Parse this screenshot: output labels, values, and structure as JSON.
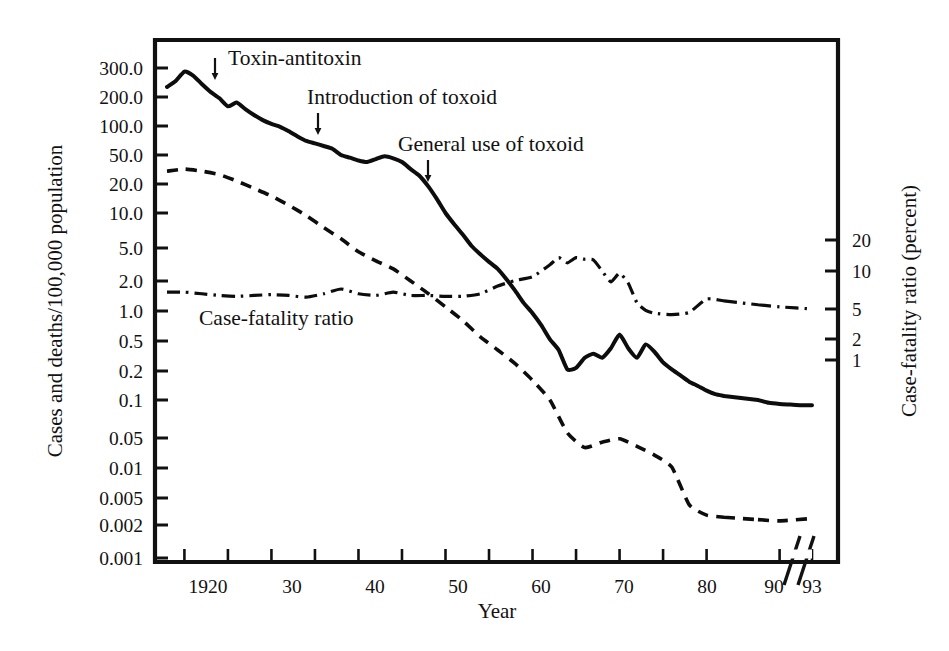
{
  "chart_data": {
    "type": "line",
    "title": "",
    "xlabel": "Year",
    "ylabel": "Cases and deaths/100,000 population",
    "ylabel_right": "Case-fatality ratio (percent)",
    "yscale": "log",
    "xlim": [
      1918,
      1993
    ],
    "axis_break": {
      "present": true,
      "between": [
        1982,
        1988
      ]
    },
    "grid": false,
    "legend_position": "inline-annotations",
    "yticks_left": [
      "300.0",
      "200.0",
      "100.0",
      "50.0",
      "20.0",
      "10.0",
      "5.0",
      "2.0",
      "1.0",
      "0.5",
      "0.2",
      "0.1",
      "0.05",
      "0.01",
      "0.005",
      "0.002",
      "0.001"
    ],
    "ytick_values_left": [
      300,
      200,
      100,
      50,
      20,
      10,
      5,
      2,
      1,
      0.5,
      0.2,
      0.1,
      0.05,
      0.01,
      0.005,
      0.002,
      0.001
    ],
    "yticks_right": [
      "20",
      "10",
      "5",
      "2",
      "1"
    ],
    "ytick_values_right": [
      20,
      10,
      5,
      2,
      1
    ],
    "xticks": [
      "1920",
      "30",
      "40",
      "50",
      "60",
      "70",
      "80",
      "90",
      "93"
    ],
    "xtick_values": [
      1920,
      1930,
      1940,
      1950,
      1960,
      1970,
      1980,
      1990,
      1993
    ],
    "xtick_minor_values": [
      1925,
      1935,
      1945,
      1955,
      1965,
      1975
    ],
    "series": [
      {
        "name": "Cases",
        "style": "solid",
        "axis": "left",
        "x": [
          1918,
          1919,
          1920,
          1921,
          1922,
          1923,
          1924,
          1925,
          1926,
          1927,
          1928,
          1929,
          1930,
          1931,
          1932,
          1933,
          1934,
          1935,
          1936,
          1937,
          1938,
          1939,
          1940,
          1941,
          1942,
          1943,
          1944,
          1945,
          1946,
          1947,
          1948,
          1949,
          1950,
          1951,
          1952,
          1953,
          1954,
          1955,
          1956,
          1957,
          1958,
          1959,
          1960,
          1961,
          1962,
          1963,
          1964,
          1965,
          1966,
          1967,
          1968,
          1969,
          1970,
          1971,
          1972,
          1973,
          1974,
          1975,
          1976,
          1977,
          1978,
          1979,
          1980,
          1981,
          1982,
          1988,
          1989,
          1990,
          1991,
          1992,
          1993
        ],
        "y": [
          230,
          250,
          285,
          270,
          240,
          215,
          195,
          160,
          175,
          150,
          130,
          115,
          105,
          98,
          88,
          78,
          70,
          66,
          62,
          58,
          50,
          46,
          42,
          40,
          44,
          48,
          45,
          40,
          32,
          26,
          19,
          14,
          10,
          8,
          6.5,
          5.2,
          4.2,
          3.4,
          2.8,
          2.1,
          1.6,
          1.2,
          0.95,
          0.72,
          0.52,
          0.38,
          0.21,
          0.22,
          0.3,
          0.34,
          0.3,
          0.4,
          0.58,
          0.4,
          0.3,
          0.45,
          0.36,
          0.26,
          0.21,
          0.18,
          0.155,
          0.14,
          0.125,
          0.115,
          0.11,
          0.1,
          0.095,
          0.093,
          0.092,
          0.091,
          0.091
        ]
      },
      {
        "name": "Deaths",
        "style": "dashed",
        "axis": "left",
        "x": [
          1918,
          1920,
          1922,
          1924,
          1926,
          1928,
          1930,
          1932,
          1934,
          1936,
          1938,
          1940,
          1942,
          1944,
          1946,
          1948,
          1950,
          1952,
          1954,
          1956,
          1958,
          1960,
          1962,
          1964,
          1966,
          1968,
          1970,
          1972,
          1974,
          1976,
          1978,
          1980,
          1982,
          1988,
          1990,
          1993
        ],
        "y": [
          30,
          32,
          30,
          27,
          22,
          18,
          15,
          12,
          9.5,
          7.5,
          6.0,
          4.5,
          3.5,
          2.8,
          2.0,
          1.5,
          1.1,
          0.8,
          0.55,
          0.38,
          0.25,
          0.16,
          0.1,
          0.055,
          0.03,
          0.04,
          0.048,
          0.032,
          0.02,
          0.0105,
          0.004,
          0.0028,
          0.0026,
          0.0024,
          0.0023,
          0.0025
        ]
      },
      {
        "name": "Case-fatality ratio",
        "style": "dash-dot",
        "axis": "right",
        "x": [
          1918,
          1920,
          1922,
          1924,
          1926,
          1928,
          1930,
          1932,
          1934,
          1936,
          1938,
          1940,
          1942,
          1944,
          1946,
          1948,
          1950,
          1952,
          1954,
          1956,
          1958,
          1960,
          1962,
          1963,
          1964,
          1965,
          1966,
          1967,
          1968,
          1969,
          1970,
          1971,
          1972,
          1973,
          1974,
          1976,
          1978,
          1980,
          1982,
          1988,
          1990,
          1993
        ],
        "y": [
          6.8,
          6.8,
          6.6,
          6.4,
          6.3,
          6.4,
          6.5,
          6.4,
          6.2,
          6.6,
          7.2,
          6.6,
          6.4,
          6.8,
          6.4,
          6.4,
          6.3,
          6.3,
          6.6,
          7.6,
          8.4,
          9.0,
          11.5,
          13.5,
          12.0,
          13.5,
          13.0,
          12.8,
          10.0,
          8.2,
          9.6,
          8.0,
          5.6,
          4.8,
          4.4,
          4.2,
          4.5,
          6.0,
          5.8,
          5.4,
          5.2,
          5.0
        ]
      }
    ],
    "annotations": [
      {
        "label": "Toxin-antitoxin",
        "x": 1921,
        "points_to_series": "Cases"
      },
      {
        "label": "Introduction of toxoid",
        "x": 1932,
        "points_to_series": "Cases"
      },
      {
        "label": "General use of toxoid",
        "x": 1941,
        "points_to_series": "Cases"
      },
      {
        "label": "Case-fatality ratio",
        "x": 1929,
        "points_to_series": "Case-fatality ratio"
      }
    ]
  },
  "axes": {
    "left_title": "Cases and deaths/100,000 population",
    "right_title": "Case-fatality ratio (percent)",
    "bottom_title": "Year"
  },
  "left_ticks": [
    {
      "label": "300.0",
      "y": 68
    },
    {
      "label": "200.0",
      "y": 97
    },
    {
      "label": "100.0",
      "y": 126
    },
    {
      "label": "50.0",
      "y": 155
    },
    {
      "label": "20.0",
      "y": 184
    },
    {
      "label": "10.0",
      "y": 213
    },
    {
      "label": "5.0",
      "y": 248
    },
    {
      "label": "2.0",
      "y": 281
    },
    {
      "label": "1.0",
      "y": 311
    },
    {
      "label": "0.5",
      "y": 341
    },
    {
      "label": "0.2",
      "y": 371
    },
    {
      "label": "0.1",
      "y": 400
    },
    {
      "label": "0.05",
      "y": 438
    },
    {
      "label": "0.01",
      "y": 468
    },
    {
      "label": "0.005",
      "y": 498
    },
    {
      "label": "0.002",
      "y": 525
    },
    {
      "label": "0.001",
      "y": 558
    }
  ],
  "right_ticks": [
    {
      "label": "20",
      "y": 240
    },
    {
      "label": "10",
      "y": 271
    },
    {
      "label": "5",
      "y": 309
    },
    {
      "label": "2",
      "y": 339
    },
    {
      "label": "1",
      "y": 360
    }
  ],
  "x_ticks": [
    {
      "label": "1920",
      "x": 208
    },
    {
      "label": "30",
      "x": 292
    },
    {
      "label": "40",
      "x": 375
    },
    {
      "label": "50",
      "x": 458
    },
    {
      "label": "60",
      "x": 541
    },
    {
      "label": "70",
      "x": 624
    },
    {
      "label": "80",
      "x": 707
    },
    {
      "label": "90",
      "x": 774
    },
    {
      "label": "93",
      "x": 812
    }
  ],
  "annotations": [
    {
      "name": "toxin-antitoxin",
      "label": "Toxin-antitoxin",
      "text_x": 228,
      "text_y": 65,
      "arrow_x": 215,
      "arrow_y0": 58,
      "arrow_y1": 80
    },
    {
      "name": "introduction-of-toxoid",
      "label": "Introduction of toxoid",
      "text_x": 307,
      "text_y": 104,
      "arrow_x": 318,
      "arrow_y0": 113,
      "arrow_y1": 135
    },
    {
      "name": "general-use-of-toxoid",
      "label": "General use of toxoid",
      "text_x": 398,
      "text_y": 151,
      "arrow_x": 428,
      "arrow_y0": 160,
      "arrow_y1": 182
    },
    {
      "name": "case-fatality-ratio",
      "label": "Case-fatality ratio",
      "text_x": 199,
      "text_y": 325
    }
  ]
}
